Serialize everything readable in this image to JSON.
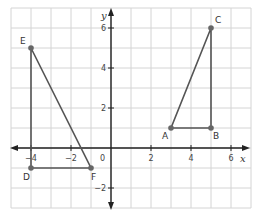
{
  "diagram": {
    "type": "coordinate-plane",
    "axes": {
      "x_label": "x",
      "y_label": "y",
      "origin_label": "0",
      "x_ticks": [
        {
          "value": -4,
          "label": "−4"
        },
        {
          "value": -2,
          "label": "−2"
        },
        {
          "value": 2,
          "label": "2"
        },
        {
          "value": 4,
          "label": "4"
        },
        {
          "value": 6,
          "label": "6"
        }
      ],
      "y_ticks": [
        {
          "value": 6,
          "label": "6"
        },
        {
          "value": 4,
          "label": "4"
        },
        {
          "value": 2,
          "label": "2"
        },
        {
          "value": -2,
          "label": "−2"
        }
      ],
      "x_range": [
        -5,
        7
      ],
      "y_range": [
        -3,
        7
      ],
      "grid": true
    },
    "points": [
      {
        "name": "A",
        "x": 3,
        "y": 1
      },
      {
        "name": "B",
        "x": 5,
        "y": 1
      },
      {
        "name": "C",
        "x": 5,
        "y": 6
      },
      {
        "name": "D",
        "x": -4,
        "y": -1
      },
      {
        "name": "E",
        "x": -4,
        "y": 5
      },
      {
        "name": "F",
        "x": -1,
        "y": -1
      }
    ],
    "triangles": [
      {
        "name": "ABC",
        "vertices": [
          "A",
          "B",
          "C"
        ]
      },
      {
        "name": "DEF",
        "vertices": [
          "D",
          "E",
          "F"
        ]
      }
    ],
    "colors": {
      "grid": "#d4d4d4",
      "axis": "#222222",
      "shape": "#555555",
      "point": "#666666"
    }
  }
}
